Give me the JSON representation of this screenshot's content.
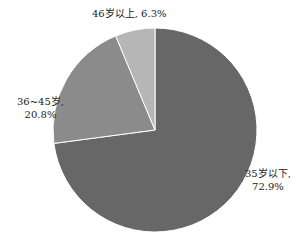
{
  "chart_data": {
    "type": "pie",
    "title": "",
    "start_angle_deg": 0,
    "direction": "clockwise",
    "categories": [
      "35岁以下",
      "36~45岁",
      "46岁以上"
    ],
    "values": [
      72.9,
      20.8,
      6.3
    ],
    "unit": "%",
    "colors": [
      "#676767",
      "#8b8b8b",
      "#b6b6b6"
    ],
    "data_labels": [
      {
        "name": "35岁以下,",
        "value": "72.9%"
      },
      {
        "name": "36~45岁,",
        "value": "20.8%"
      },
      {
        "name": "46岁以上,",
        "value": "6.3%"
      }
    ],
    "legend": "none",
    "separator_color": "#ffffff"
  }
}
